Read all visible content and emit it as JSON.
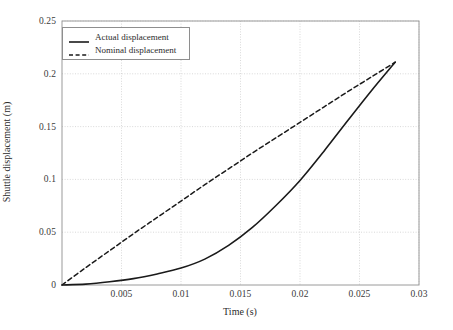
{
  "chart_data": {
    "type": "line",
    "title": "",
    "xlabel": "Time (s)",
    "ylabel": "Shuttle displacement (m)",
    "xlim": [
      0,
      0.03
    ],
    "ylim": [
      0,
      0.25
    ],
    "xticks": [
      "0.005",
      "0.01",
      "0.015",
      "0.02",
      "0.025",
      "0.03"
    ],
    "xtick_values": [
      0.005,
      0.01,
      0.015,
      0.02,
      0.025,
      0.03
    ],
    "yticks": [
      "0",
      "0.05",
      "0.1",
      "0.15",
      "0.2",
      "0.25"
    ],
    "ytick_values": [
      0,
      0.05,
      0.1,
      0.15,
      0.2,
      0.25
    ],
    "grid": true,
    "legend_position": "upper-left",
    "series": [
      {
        "name": "Actual displacement",
        "style": "solid",
        "color": "#1a1a1a",
        "x": [
          0,
          0.002,
          0.004,
          0.006,
          0.008,
          0.01,
          0.012,
          0.014,
          0.016,
          0.018,
          0.02,
          0.022,
          0.024,
          0.026,
          0.028
        ],
        "y": [
          0,
          0.0008,
          0.003,
          0.006,
          0.0105,
          0.016,
          0.0245,
          0.0375,
          0.0545,
          0.0755,
          0.099,
          0.1265,
          0.1555,
          0.184,
          0.211
        ]
      },
      {
        "name": "Nominal displacement",
        "style": "dashed",
        "color": "#1a1a1a",
        "x": [
          0,
          0.002,
          0.004,
          0.006,
          0.008,
          0.01,
          0.012,
          0.014,
          0.016,
          0.018,
          0.02,
          0.022,
          0.024,
          0.026,
          0.028
        ],
        "y": [
          0,
          0.0165,
          0.0325,
          0.0485,
          0.064,
          0.0795,
          0.095,
          0.11,
          0.125,
          0.1395,
          0.154,
          0.1685,
          0.183,
          0.197,
          0.211
        ]
      }
    ],
    "annotations": []
  },
  "legend": {
    "items": [
      {
        "label": "Actual displacement",
        "style": "solid"
      },
      {
        "label": "Nominal displacement",
        "style": "dashed"
      }
    ]
  }
}
